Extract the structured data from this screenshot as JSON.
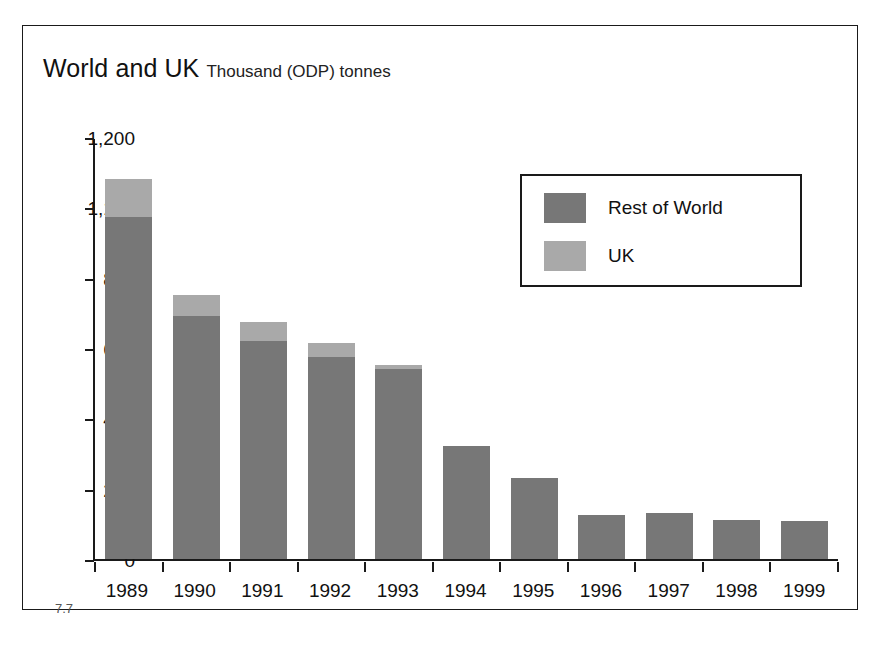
{
  "figure": {
    "number": "7.7",
    "title_main": "World and UK",
    "title_sub": "Thousand (ODP) tonnes"
  },
  "legend": {
    "position": "top-right",
    "items": [
      {
        "label": "Rest of World",
        "color": "#777777",
        "swatch": "legend-swatch-rest-of-world"
      },
      {
        "label": "UK",
        "color": "#a9a9a9",
        "swatch": "legend-swatch-uk"
      }
    ]
  },
  "chart_data": {
    "type": "bar",
    "subtype": "stacked-column",
    "title": "World and UK",
    "subtitle": "Thousand (ODP) tonnes",
    "xlabel": "",
    "ylabel": "Thousand (ODP) tonnes",
    "grid": false,
    "legend_position": "top-right",
    "axis_note": "Y-axis tick labels are unevenly spaced in value but evenly spaced in pixels (broken scale between 1,100 and 800).",
    "ylim": [
      0,
      1200
    ],
    "yticks": [
      1200,
      1100,
      800,
      600,
      400,
      200,
      0
    ],
    "ytick_labels": [
      "1,200",
      "1,100",
      "800",
      "600",
      "400",
      "200",
      "0"
    ],
    "categories": [
      "1989",
      "1990",
      "1991",
      "1992",
      "1993",
      "1994",
      "1995",
      "1996",
      "1997",
      "1998",
      "1999"
    ],
    "series": [
      {
        "name": "Rest of World",
        "color": "#777777",
        "values": [
          1060,
          690,
          620,
          575,
          540,
          320,
          230,
          125,
          132,
          112,
          108
        ]
      },
      {
        "name": "UK",
        "color": "#a9a9a9",
        "values": [
          80,
          60,
          55,
          40,
          12,
          0,
          0,
          0,
          0,
          0,
          0
        ]
      }
    ],
    "totals": [
      1140,
      750,
      675,
      615,
      552,
      320,
      230,
      125,
      132,
      112,
      108
    ]
  }
}
